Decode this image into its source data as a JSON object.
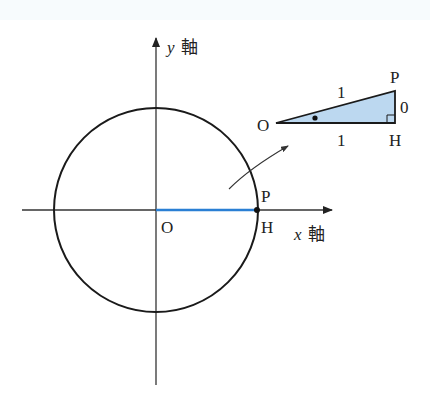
{
  "diagram": {
    "type": "unit-circle",
    "colors": {
      "stroke": "#1a1a1a",
      "axis": "#333333",
      "segment_oh": "#2a7fd4",
      "triangle_fill": "#bcd8f0",
      "background": "#ffffff"
    },
    "axes": {
      "x_label_var": "x",
      "x_label_kanji": "軸",
      "y_label_var": "y",
      "y_label_kanji": "軸"
    },
    "points": {
      "origin": "O",
      "p": "P",
      "h": "H"
    },
    "inset_triangle": {
      "vertex_o": "O",
      "vertex_p": "P",
      "vertex_h": "H",
      "hypotenuse_label": "1",
      "base_label": "1",
      "height_label": "0"
    }
  }
}
